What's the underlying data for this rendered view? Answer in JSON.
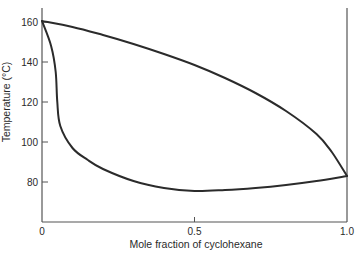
{
  "chart_data": {
    "type": "line",
    "title": "",
    "xlabel": "Mole fraction of cyclohexane",
    "ylabel": "Temperature (°C)",
    "xlim": [
      0,
      1.0
    ],
    "ylim": [
      60,
      166
    ],
    "x_ticks": [
      {
        "value": 0,
        "label": "0"
      },
      {
        "value": 0.5,
        "label": "0.5"
      },
      {
        "value": 1.0,
        "label": "1.0"
      }
    ],
    "y_ticks": [
      {
        "value": 80,
        "label": "80"
      },
      {
        "value": 100,
        "label": "100"
      },
      {
        "value": 120,
        "label": "120"
      },
      {
        "value": 140,
        "label": "140"
      },
      {
        "value": 160,
        "label": "160"
      }
    ],
    "grid": false,
    "legend": null,
    "series": [
      {
        "name": "upper curve",
        "x": [
          0.0,
          0.1,
          0.2,
          0.3,
          0.4,
          0.5,
          0.6,
          0.7,
          0.8,
          0.9,
          0.95,
          1.0
        ],
        "y": [
          160.5,
          157.5,
          153.5,
          149,
          144,
          138.5,
          132,
          124.5,
          115.5,
          104,
          95,
          83
        ]
      },
      {
        "name": "lower curve",
        "x": [
          0.0,
          0.03,
          0.045,
          0.05,
          0.06,
          0.1,
          0.15,
          0.2,
          0.3,
          0.4,
          0.5,
          0.6,
          0.7,
          0.8,
          0.9,
          1.0
        ],
        "y": [
          160.5,
          148,
          135,
          120,
          108,
          97,
          91,
          86.5,
          80.5,
          77,
          75.5,
          76,
          77,
          78.5,
          80.5,
          83
        ]
      }
    ]
  }
}
